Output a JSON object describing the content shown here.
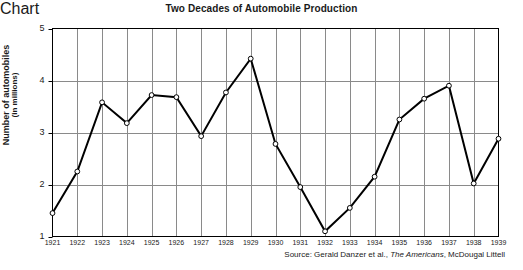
{
  "chart_data": {
    "type": "line",
    "title": "Two Decades of Automobile Production",
    "xlabel": "",
    "ylabel": "Number of automobiles",
    "ylabel_sub": "(in millions)",
    "categories": [
      "1921",
      "1922",
      "1923",
      "1924",
      "1925",
      "1926",
      "1927",
      "1928",
      "1929",
      "1930",
      "1931",
      "1932",
      "1933",
      "1934",
      "1935",
      "1936",
      "1937",
      "1938",
      "1939"
    ],
    "values": [
      1.45,
      2.25,
      3.58,
      3.18,
      3.72,
      3.68,
      2.93,
      3.77,
      4.42,
      2.78,
      1.95,
      1.1,
      1.55,
      2.15,
      3.25,
      3.65,
      3.9,
      2.02,
      2.88
    ],
    "ylim": [
      1,
      5
    ],
    "yticks": [
      1,
      2,
      3,
      4,
      5
    ],
    "ytick_labels": [
      "1",
      "2",
      "3",
      "4",
      "5"
    ],
    "grid": true,
    "grid_x": true,
    "grid_y": true,
    "legend": false,
    "legend_position": "none",
    "marker": "open-circle",
    "line_color": "#000000",
    "marker_fill": "#ffffff",
    "grid_color": "#8a8a8a",
    "axis_color": "#000000"
  },
  "source": {
    "prefix": "Source: Gerald Danzer et al.,",
    "italic_title": " The Americans",
    "suffix": ", McDougal Littell"
  }
}
